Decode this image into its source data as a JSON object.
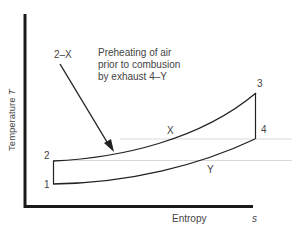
{
  "diagram": {
    "type": "T-s diagram",
    "annotation": {
      "arrow_label": "2–X",
      "text_lines": [
        "Preheating of air",
        "prior to combusion",
        "by exhaust 4–Y"
      ]
    },
    "axes": {
      "y_label": "Temperature",
      "y_symbol": "T",
      "x_label": "Entropy",
      "x_symbol": "s"
    },
    "points": {
      "p1": "1",
      "p2": "2",
      "p3": "3",
      "p4": "4",
      "pX": "X",
      "pY": "Y"
    }
  }
}
